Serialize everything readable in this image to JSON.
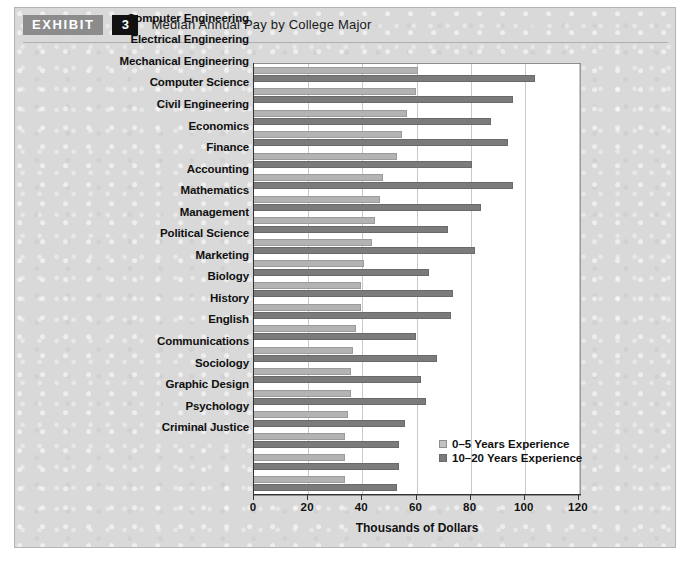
{
  "exhibit": {
    "tag_label": "EXHIBIT",
    "number": "3",
    "title": "Median Annual Pay by College Major"
  },
  "colors": {
    "card_background": "#d9d9d9",
    "plot_background": "#ffffff",
    "series_light": "#b3b3b3",
    "series_dark": "#7b7b7b",
    "tag_background": "#8c8c8c",
    "number_background": "#111111",
    "gridline": "#c9c9c9",
    "axis": "#333333"
  },
  "legend": {
    "position": "inside-bottom-right",
    "entries": [
      {
        "label": "0–5 Years Experience",
        "swatch": "light"
      },
      {
        "label": "10–20 Years Experience",
        "swatch": "dark"
      }
    ]
  },
  "chart_data": {
    "type": "bar",
    "orientation": "horizontal",
    "title": "Median Annual Pay by College Major",
    "xlabel": "Thousands of Dollars",
    "ylabel": "",
    "xlim": [
      0,
      120
    ],
    "xticks": [
      0,
      20,
      40,
      60,
      80,
      100,
      120
    ],
    "xtick_labels": [
      "0",
      "20",
      "40",
      "60",
      "80",
      "100",
      "120"
    ],
    "grid": "vertical",
    "legend_position": "lower right",
    "categories": [
      "Computer Engineering",
      "Electrical Engineering",
      "Mechanical Engineering",
      "Computer Science",
      "Civil Engineering",
      "Economics",
      "Finance",
      "Accounting",
      "Mathematics",
      "Management",
      "Political Science",
      "Marketing",
      "Biology",
      "History",
      "English",
      "Communications",
      "Sociology",
      "Graphic Design",
      "Psychology",
      "Criminal Justice"
    ],
    "series": [
      {
        "name": "0–5 Years Experience",
        "color": "#b3b3b3",
        "values": [
          61,
          60,
          57,
          55,
          53,
          48,
          47,
          45,
          44,
          41,
          40,
          40,
          38,
          37,
          36,
          36,
          35,
          34,
          34,
          34
        ]
      },
      {
        "name": "10–20 Years Experience",
        "color": "#7b7b7b",
        "values": [
          104,
          96,
          88,
          94,
          81,
          96,
          84,
          72,
          82,
          65,
          74,
          73,
          60,
          68,
          62,
          64,
          56,
          54,
          54,
          53
        ]
      }
    ]
  }
}
